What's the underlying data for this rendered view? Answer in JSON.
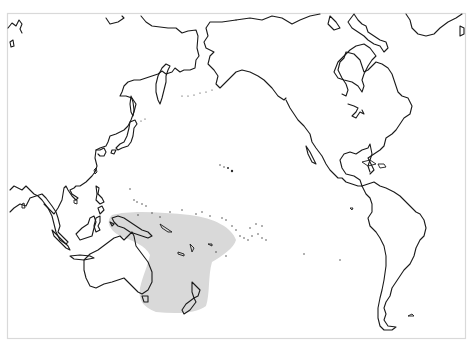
{
  "map": {
    "title": "",
    "projection": "Pacific-centered world map",
    "background_color": "#ffffff",
    "frame_color": "#d9d9d9",
    "coastline_color": "#1a1a1a",
    "range": {
      "label": "Distribution range",
      "color": "#d9d9d9",
      "regions_covered": [
        "Eastern Australia",
        "New Guinea",
        "Tasmania",
        "New Zealand",
        "Solomon Islands",
        "Vanuatu",
        "New Caledonia",
        "Fiji"
      ]
    },
    "visible_landmasses": [
      "Asia",
      "Japan",
      "Kamchatka",
      "Alaska",
      "North America",
      "Greenland",
      "Central America",
      "Caribbean",
      "South America",
      "Southeast Asia",
      "Borneo",
      "Australia",
      "New Zealand",
      "Hawaii",
      "Pacific Islands"
    ]
  }
}
